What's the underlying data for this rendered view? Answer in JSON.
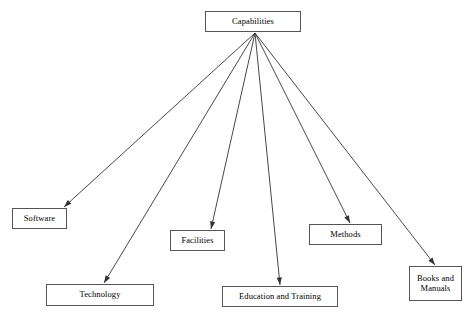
{
  "diagram": {
    "type": "tree",
    "title": "Capabilities",
    "canvas": {
      "width": 470,
      "height": 316
    },
    "style": {
      "background_color": "#ffffff",
      "box_border_color": "#555555",
      "box_fill_color": "#ffffff",
      "edge_color": "#333333",
      "text_color": "#000000"
    },
    "root": {
      "id": "capabilities",
      "label": "Capabilities",
      "x": 205,
      "y": 11,
      "width": 96,
      "height": 21,
      "font_size": 8.5
    },
    "children": [
      {
        "id": "software",
        "label": "Software",
        "x": 12,
        "y": 208,
        "width": 55,
        "height": 21,
        "font_size": 8.5,
        "arrow_to": {
          "x": 64,
          "y": 207
        }
      },
      {
        "id": "technology",
        "label": "Technology",
        "x": 46,
        "y": 284,
        "width": 108,
        "height": 22,
        "font_size": 8.5,
        "arrow_to": {
          "x": 104,
          "y": 283
        }
      },
      {
        "id": "facilities",
        "label": "Facilities",
        "x": 170,
        "y": 230,
        "width": 55,
        "height": 21,
        "font_size": 8.5,
        "arrow_to": {
          "x": 211,
          "y": 229
        }
      },
      {
        "id": "education-and-training",
        "label": "Education and Training",
        "x": 222,
        "y": 286,
        "width": 116,
        "height": 21,
        "font_size": 8.5,
        "arrow_to": {
          "x": 280,
          "y": 285
        }
      },
      {
        "id": "methods",
        "label": "Methods",
        "x": 309,
        "y": 224,
        "width": 73,
        "height": 21,
        "font_size": 8.5,
        "arrow_to": {
          "x": 350,
          "y": 223
        }
      },
      {
        "id": "books-and-manuals",
        "label": "Books and\nManuals",
        "x": 409,
        "y": 266,
        "width": 53,
        "height": 35,
        "font_size": 8.5,
        "arrow_to": {
          "x": 435,
          "y": 265
        }
      }
    ],
    "edge_origin": {
      "x": 255,
      "y": 33
    }
  }
}
